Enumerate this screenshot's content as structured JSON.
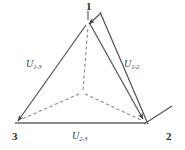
{
  "figure": {
    "type": "vector-triangle-diagram",
    "background_color": "#ffffff",
    "solid_stroke_color": "#555555",
    "dashed_stroke_color": "#777777",
    "text_color": "#2b2b2b"
  },
  "nodes": [
    {
      "id": "1",
      "label": "1",
      "x": 88,
      "y": 22,
      "position": "apex"
    },
    {
      "id": "2",
      "label": "2",
      "x": 145,
      "y": 123,
      "position": "bottom-right"
    },
    {
      "id": "3",
      "label": "3",
      "x": 16,
      "y": 123,
      "position": "bottom-left"
    }
  ],
  "centroid": {
    "x": 82,
    "y": 92
  },
  "edges": [
    {
      "name": "edge-1-3",
      "label_main": "U",
      "label_sub": "1-3",
      "from": "3",
      "to": "1",
      "style": "solid",
      "arrow": "at-node-3"
    },
    {
      "name": "edge-1-2",
      "label_main": "U",
      "label_sub": "1-2",
      "from": "1",
      "to": "2",
      "style": "solid-double",
      "arrow": "at-node-2"
    },
    {
      "name": "edge-2-3",
      "label_main": "U",
      "label_sub": "2-3",
      "from": "2",
      "to": "3",
      "style": "solid",
      "arrow": "none"
    }
  ],
  "dashed_lines": [
    {
      "name": "centroid-to-node-1",
      "from": "centroid",
      "to": "1"
    },
    {
      "name": "centroid-to-node-2",
      "from": "centroid",
      "to": "2"
    },
    {
      "name": "centroid-to-node-3",
      "from": "centroid",
      "to": "3"
    }
  ]
}
